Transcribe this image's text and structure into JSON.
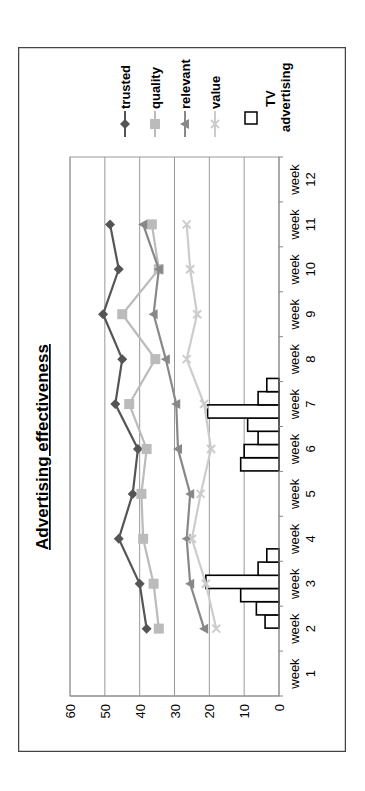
{
  "chart_data": {
    "type": "line",
    "title": "Advertising effectiveness",
    "xlabel": "",
    "ylabel": "",
    "ylim": [
      0,
      60
    ],
    "yticks": [
      0,
      10,
      20,
      30,
      40,
      50,
      60
    ],
    "grid": true,
    "orientation": "rotated 90 degrees counter-clockwise",
    "legend_position": "right",
    "categories": [
      "week 1",
      "week 2",
      "week 3",
      "week 4",
      "week 5",
      "week 6",
      "week 7",
      "week 8",
      "week 9",
      "week 10",
      "week 11",
      "week 12"
    ],
    "series": [
      {
        "name": "trusted",
        "marker": "diamond",
        "color": "#555555",
        "values": [
          null,
          38,
          40,
          46,
          42,
          40.5,
          47,
          45,
          50.5,
          46,
          48.5,
          null
        ]
      },
      {
        "name": "quality",
        "marker": "square",
        "color": "#bbbbbb",
        "values": [
          null,
          34.5,
          36,
          39,
          39.5,
          38,
          43,
          35.5,
          45,
          34.5,
          36.5,
          null
        ]
      },
      {
        "name": "relevant",
        "marker": "triangle",
        "color": "#888888",
        "values": [
          null,
          21.5,
          25.5,
          26.5,
          25.5,
          29,
          29.5,
          32.5,
          36,
          34.5,
          39,
          null
        ]
      },
      {
        "name": "value",
        "marker": "x",
        "color": "#cccccc",
        "values": [
          null,
          18,
          21,
          25,
          22.5,
          19.5,
          21.5,
          26.5,
          23.5,
          25.5,
          26.5,
          null
        ]
      }
    ],
    "bar_series": {
      "name": "TV advertising",
      "type": "bar",
      "fill": "#ffffff",
      "stroke": "#000000",
      "groups": [
        {
          "start_week_position": 2.5,
          "values": [
            4,
            6.5,
            11,
            21,
            6,
            3.5
          ]
        },
        {
          "start_week_position": 6.0,
          "values": [
            11,
            10,
            6,
            9,
            20.5,
            6,
            3.5
          ]
        }
      ]
    }
  },
  "legend": {
    "items": [
      {
        "label": "trusted"
      },
      {
        "label": "quality"
      },
      {
        "label": "relevant"
      },
      {
        "label": "value"
      },
      {
        "label_line1": "TV",
        "label_line2": "advertising"
      }
    ]
  }
}
